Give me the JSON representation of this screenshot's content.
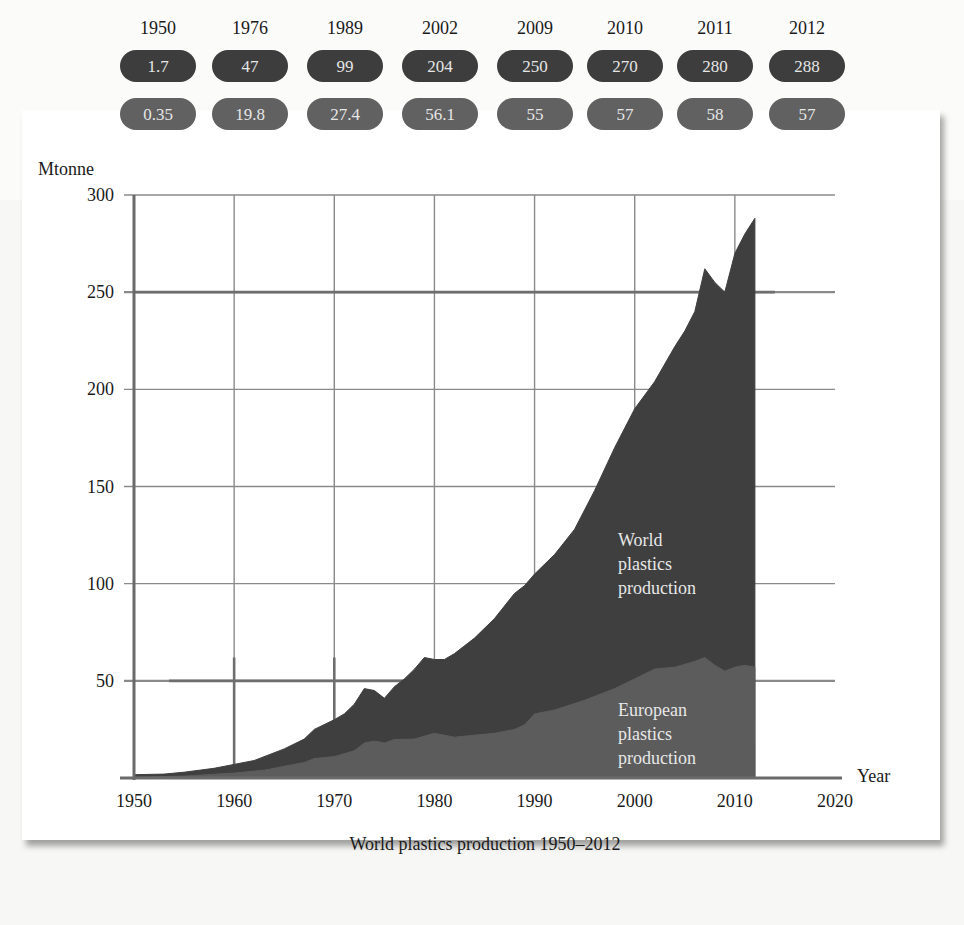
{
  "chart_data": {
    "type": "area",
    "title": "World plastics production 1950–2012",
    "xlabel": "Year",
    "ylabel": "Mtonne",
    "xlim": [
      1950,
      2020
    ],
    "ylim": [
      0,
      300
    ],
    "x_ticks": [
      1950,
      1960,
      1970,
      1980,
      1990,
      2000,
      2010,
      2020
    ],
    "y_ticks": [
      50,
      100,
      150,
      200,
      250,
      300
    ],
    "grid": true,
    "series": [
      {
        "name": "World plastics production",
        "color": "#3f3f3f",
        "x": [
          1950,
          1953,
          1955,
          1958,
          1960,
          1962,
          1965,
          1967,
          1968,
          1970,
          1971,
          1972,
          1973,
          1974,
          1975,
          1976,
          1977,
          1978,
          1979,
          1980,
          1981,
          1982,
          1984,
          1986,
          1988,
          1989,
          1990,
          1992,
          1994,
          1996,
          1998,
          2000,
          2002,
          2004,
          2005,
          2006,
          2007,
          2008,
          2009,
          2010,
          2011,
          2012
        ],
        "values": [
          1.7,
          2,
          3,
          5,
          7,
          9,
          15,
          20,
          25,
          30,
          33,
          38,
          46,
          45,
          41,
          47,
          51,
          56,
          62,
          61,
          61,
          64,
          72,
          82,
          95,
          99,
          105,
          115,
          128,
          148,
          170,
          190,
          204,
          222,
          230,
          240,
          262,
          255,
          250,
          270,
          280,
          288
        ]
      },
      {
        "name": "European plastics production",
        "color": "#5c5c5c",
        "x": [
          1950,
          1955,
          1960,
          1963,
          1965,
          1967,
          1968,
          1970,
          1972,
          1973,
          1974,
          1975,
          1976,
          1978,
          1980,
          1982,
          1984,
          1986,
          1988,
          1989,
          1990,
          1992,
          1995,
          1998,
          2000,
          2002,
          2004,
          2006,
          2007,
          2008,
          2009,
          2010,
          2011,
          2012
        ],
        "values": [
          0.35,
          1,
          2.5,
          4,
          6,
          8,
          10,
          11,
          14,
          18,
          19,
          18,
          19.8,
          20,
          23,
          21,
          22,
          23,
          25,
          27.4,
          33,
          35,
          40,
          46,
          51,
          56.1,
          57,
          60,
          62,
          58,
          55,
          57,
          58,
          57
        ]
      }
    ],
    "annotations": [
      {
        "text": "World plastics production",
        "x": 2002,
        "y": 100
      },
      {
        "text": "European plastics production",
        "x": 2002,
        "y": 25
      }
    ],
    "table": {
      "years": [
        "1950",
        "1976",
        "1989",
        "2002",
        "2009",
        "2010",
        "2011",
        "2012"
      ],
      "world": [
        "1.7",
        "47",
        "99",
        "204",
        "250",
        "270",
        "280",
        "288"
      ],
      "europe": [
        "0.35",
        "19.8",
        "27.4",
        "56.1",
        "55",
        "57",
        "58",
        "57"
      ]
    }
  },
  "labels": {
    "y_unit": "Mtonne",
    "x_unit": "Year",
    "world_area": [
      "World",
      "plastics",
      "production"
    ],
    "europe_area": [
      "European",
      "plastics",
      "production"
    ],
    "caption": "World plastics production 1950–2012"
  },
  "colors": {
    "world_fill": "#3f3f3f",
    "europe_fill": "#5c5c5c",
    "world_pill": "#3d3d3d",
    "europe_pill": "#616161",
    "grid": "#8a8a8a"
  }
}
